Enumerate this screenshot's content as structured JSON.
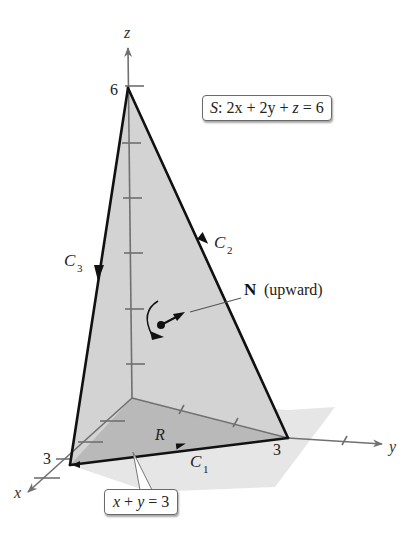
{
  "diagram": {
    "colors": {
      "background": "#ffffff",
      "surface_fill": "#d4d4d4",
      "region_fill": "#b8b8b8",
      "shadow_fill": "#e4e4e4",
      "axis_color": "#707070",
      "edge_color": "#111111"
    },
    "axes": {
      "z_label": "z",
      "y_label": "y",
      "x_label": "x",
      "z_tick_label": "6",
      "y_tick_label": "3",
      "x_tick_label": "3"
    },
    "curves": {
      "c1": {
        "letter": "C",
        "sub": "1"
      },
      "c2": {
        "letter": "C",
        "sub": "2"
      },
      "c3": {
        "letter": "C",
        "sub": "3"
      }
    },
    "region_label": "R",
    "normal": {
      "symbol": "N",
      "note": "(upward)"
    },
    "surface_equation": {
      "name": "S",
      "sep": ": ",
      "lhs_a": "2x",
      "plus1": " + ",
      "lhs_b": "2y",
      "plus2": " + ",
      "lhs_c": "z",
      "eq": " = ",
      "rhs": "6"
    },
    "line_equation": {
      "a": "x",
      "plus": " + ",
      "b": "y",
      "eq": " = ",
      "rhs": "3"
    }
  }
}
